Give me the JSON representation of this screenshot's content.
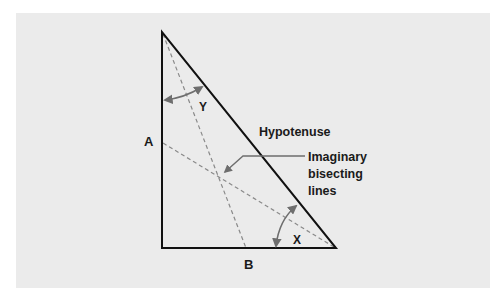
{
  "diagram": {
    "labels": {
      "side_a": "A",
      "side_b": "B",
      "angle_y": "Y",
      "angle_x": "X",
      "hypotenuse": "Hypotenuse",
      "bisector_note": [
        "Imaginary",
        "bisecting",
        "lines"
      ]
    },
    "colors": {
      "background": "#ebebeb",
      "page": "#ffffff",
      "triangle_stroke": "#111111",
      "dashed_lines": "#8a8a8a",
      "arrows": "#6e6e6e",
      "text": "#1a1a1a"
    }
  }
}
